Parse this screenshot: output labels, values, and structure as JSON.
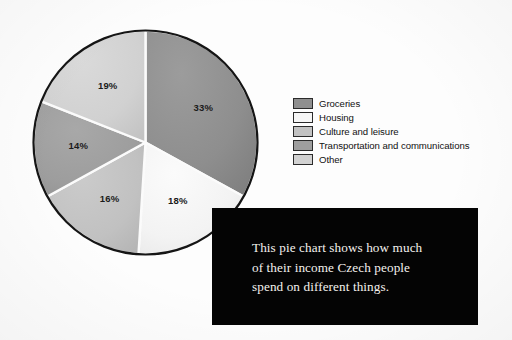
{
  "chart_data": {
    "type": "pie",
    "title": "",
    "categories": [
      "Groceries",
      "Housing",
      "Culture and leisure",
      "Transportation and communications",
      "Other"
    ],
    "values": [
      33,
      18,
      16,
      14,
      19
    ],
    "value_labels": [
      "33%",
      "18%",
      "16%",
      "14%",
      "19%"
    ],
    "unit": "%",
    "start_angle_deg": 0,
    "direction": "clockwise",
    "legend_position": "right",
    "grid": false,
    "colors": [
      "#8f8f8f",
      "#f4f4f4",
      "#c2c2c2",
      "#9e9e9e",
      "#d2d2d2"
    ],
    "slice_outline_color": "#151515",
    "slice_divider_color": "#fbfbfb"
  },
  "legend": {
    "items": [
      {
        "label": "Groceries",
        "color": "#8f8f8f"
      },
      {
        "label": "Housing",
        "color": "#f6f6f6"
      },
      {
        "label": "Culture and leisure",
        "color": "#c2c2c2"
      },
      {
        "label": "Transportation and communications",
        "color": "#9e9e9e"
      },
      {
        "label": "Other",
        "color": "#d2d2d2"
      }
    ]
  },
  "caption": {
    "lines": [
      "This pie chart shows how much",
      "of their income Czech people",
      "spend on different things."
    ],
    "background_color": "#040404",
    "text_color": "#f4f2ee"
  }
}
